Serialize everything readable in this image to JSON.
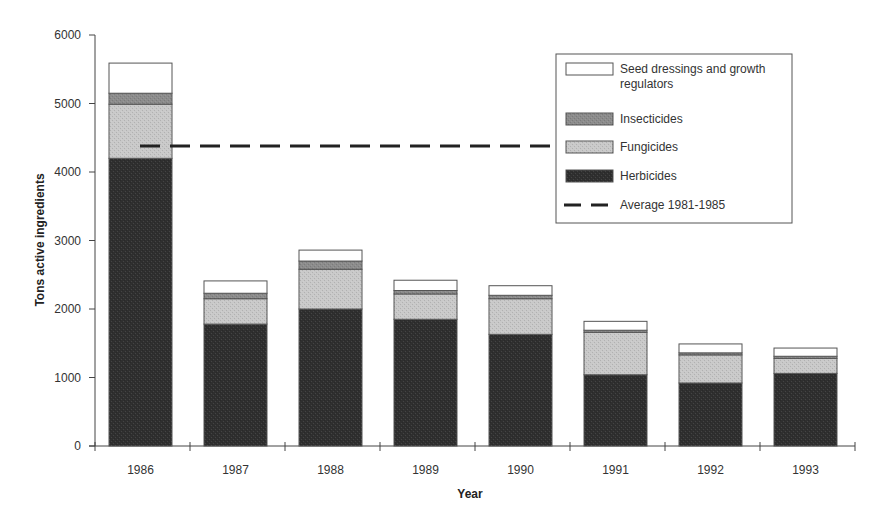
{
  "chart_data": {
    "type": "bar",
    "stacked": true,
    "title": "",
    "xlabel": "Year",
    "ylabel": "Tons active ingredients",
    "ylim": [
      0,
      6000
    ],
    "yticks": [
      0,
      1000,
      2000,
      3000,
      4000,
      5000,
      6000
    ],
    "grid": false,
    "legend_position": "top-right",
    "categories": [
      "1986",
      "1987",
      "1988",
      "1989",
      "1990",
      "1991",
      "1992",
      "1993"
    ],
    "series": [
      {
        "name": "Herbicides",
        "color": "#2f2f2f",
        "values": [
          4200,
          1780,
          2000,
          1850,
          1630,
          1040,
          920,
          1060
        ]
      },
      {
        "name": "Fungicides",
        "color": "#c9c9c9",
        "values": [
          790,
          370,
          580,
          370,
          520,
          620,
          410,
          220
        ]
      },
      {
        "name": "Insecticides",
        "color": "#8c8c8c",
        "values": [
          160,
          80,
          120,
          50,
          50,
          30,
          30,
          30
        ]
      },
      {
        "name": "Seed dressings and growth regulators",
        "color": "#ffffff",
        "values": [
          440,
          180,
          160,
          150,
          140,
          130,
          130,
          120
        ]
      }
    ],
    "reference_lines": [
      {
        "name": "Average 1981-1985",
        "value": 4380,
        "style": "dashed",
        "color": "#222222"
      }
    ],
    "legend": [
      {
        "label_lines": [
          "Seed dressings and growth",
          "regulators"
        ],
        "type": "box",
        "color": "#ffffff"
      },
      {
        "label_lines": [
          "Insecticides"
        ],
        "type": "box",
        "color": "#8c8c8c"
      },
      {
        "label_lines": [
          "Fungicides"
        ],
        "type": "box",
        "color": "#c9c9c9"
      },
      {
        "label_lines": [
          "Herbicides"
        ],
        "type": "box",
        "color": "#2f2f2f"
      },
      {
        "label_lines": [
          "Average 1981-1985"
        ],
        "type": "dash",
        "color": "#222222"
      }
    ]
  }
}
